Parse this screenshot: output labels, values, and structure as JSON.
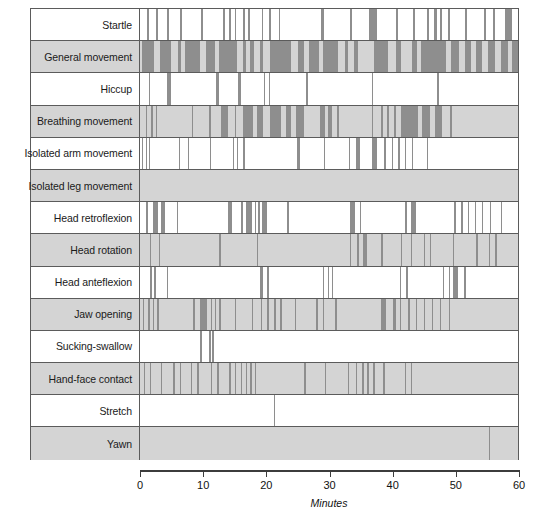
{
  "chart_data": {
    "type": "bar",
    "title": "",
    "subtitle": "",
    "xlabel": "Minutes",
    "ylabel": "",
    "xlim": [
      0,
      60
    ],
    "xticks": [
      0,
      10,
      20,
      30,
      40,
      50,
      60
    ],
    "xtick_labels": [
      "0",
      "10",
      "20",
      "30",
      "40",
      "50",
      "60"
    ],
    "grid": false,
    "legend": "none",
    "bar_color": "#8e8e8e",
    "shaded_row_color": "#d4d4d4",
    "plain_row_color": "#ffffff",
    "border_color": "#5b5b5b",
    "categories": [
      "Startle",
      "General movement",
      "Hiccup",
      "Breathing movement",
      "Isolated arm movement",
      "Isolated leg movement",
      "Head retroflexion",
      "Head rotation",
      "Head anteflexion",
      "Jaw opening",
      "Sucking-swallow",
      "Hand-face contact",
      "Stretch",
      "Yawn"
    ],
    "series": [
      {
        "name": "Startle",
        "shaded": false,
        "events": [
          [
            1.1,
            1.4
          ],
          [
            2.5,
            2.8
          ],
          [
            4.3,
            4.6
          ],
          [
            6.3,
            6.6
          ],
          [
            9.7,
            10.0
          ],
          [
            13.2,
            13.5
          ],
          [
            14.1,
            14.4
          ],
          [
            15.0,
            15.3
          ],
          [
            16.3,
            16.6
          ],
          [
            17.1,
            17.4
          ],
          [
            19.3,
            19.6
          ],
          [
            20.4,
            20.8
          ],
          [
            22.0,
            22.3
          ],
          [
            28.8,
            29.2
          ],
          [
            33.3,
            33.6
          ],
          [
            36.3,
            37.6
          ],
          [
            40.7,
            41.0
          ],
          [
            43.4,
            43.7
          ],
          [
            45.6,
            45.9
          ],
          [
            46.7,
            47.1
          ],
          [
            47.6,
            47.9
          ],
          [
            48.9,
            49.2
          ],
          [
            51.6,
            51.9
          ],
          [
            54.6,
            54.9
          ],
          [
            56.0,
            56.3
          ],
          [
            58.0,
            59.1
          ]
        ]
      },
      {
        "name": "General movement",
        "shaded": true,
        "events": [
          [
            0.3,
            2.3
          ],
          [
            3.2,
            5.0
          ],
          [
            6.0,
            6.5
          ],
          [
            7.1,
            9.6
          ],
          [
            10.4,
            11.9
          ],
          [
            12.6,
            15.4
          ],
          [
            16.3,
            16.8
          ],
          [
            17.5,
            18.1
          ],
          [
            19.0,
            19.6
          ],
          [
            20.6,
            24.0
          ],
          [
            25.0,
            26.0
          ],
          [
            26.8,
            28.4
          ],
          [
            29.1,
            31.4
          ],
          [
            32.6,
            33.0
          ],
          [
            34.0,
            34.6
          ],
          [
            37.1,
            39.3
          ],
          [
            40.6,
            41.4
          ],
          [
            43.2,
            44.0
          ],
          [
            44.6,
            48.6
          ],
          [
            49.4,
            50.7
          ],
          [
            51.6,
            52.6
          ],
          [
            53.3,
            54.3
          ],
          [
            55.2,
            56.3
          ],
          [
            57.3,
            58.4
          ],
          [
            59.0,
            60.0
          ]
        ]
      },
      {
        "name": "Hiccup",
        "shaded": false,
        "events": [
          [
            1.4,
            1.6
          ],
          [
            4.3,
            4.9
          ],
          [
            12.0,
            12.6
          ],
          [
            15.5,
            16.1
          ],
          [
            19.7,
            19.9
          ],
          [
            20.5,
            20.7
          ],
          [
            26.4,
            26.6
          ],
          [
            36.8,
            37.0
          ],
          [
            47.2,
            47.4
          ]
        ]
      },
      {
        "name": "Breathing movement",
        "shaded": true,
        "events": [
          [
            0.9,
            1.1
          ],
          [
            1.8,
            2.1
          ],
          [
            2.5,
            2.7
          ],
          [
            8.2,
            8.4
          ],
          [
            10.9,
            11.2
          ],
          [
            12.8,
            14.0
          ],
          [
            15.0,
            15.3
          ],
          [
            16.3,
            18.0
          ],
          [
            18.6,
            19.6
          ],
          [
            20.6,
            22.4
          ],
          [
            23.1,
            24.0
          ],
          [
            24.8,
            26.0
          ],
          [
            28.5,
            29.3
          ],
          [
            29.9,
            30.4
          ],
          [
            31.2,
            31.6
          ],
          [
            36.8,
            37.0
          ],
          [
            38.2,
            38.6
          ],
          [
            39.2,
            39.5
          ],
          [
            40.3,
            40.6
          ],
          [
            41.5,
            44.1
          ],
          [
            44.8,
            46.0
          ],
          [
            46.8,
            48.0
          ],
          [
            49.2,
            49.6
          ]
        ]
      },
      {
        "name": "Isolated arm movement",
        "shaded": false,
        "events": [
          [
            0.3,
            0.5
          ],
          [
            0.9,
            1.1
          ],
          [
            1.4,
            1.6
          ],
          [
            6.2,
            6.4
          ],
          [
            7.6,
            7.8
          ],
          [
            11.1,
            11.3
          ],
          [
            14.7,
            14.9
          ],
          [
            15.4,
            15.6
          ],
          [
            16.4,
            16.6
          ],
          [
            24.9,
            25.4
          ],
          [
            29.2,
            29.4
          ],
          [
            33.1,
            33.3
          ],
          [
            34.3,
            34.9
          ],
          [
            36.8,
            37.6
          ],
          [
            38.8,
            39.0
          ],
          [
            40.0,
            40.2
          ],
          [
            41.0,
            41.2
          ],
          [
            42.1,
            42.3
          ],
          [
            43.1,
            43.3
          ],
          [
            45.5,
            45.7
          ]
        ]
      },
      {
        "name": "Isolated leg movement",
        "shaded": true,
        "events": []
      },
      {
        "name": "Head retroflexion",
        "shaded": false,
        "events": [
          [
            1.0,
            1.2
          ],
          [
            2.1,
            2.9
          ],
          [
            3.3,
            3.9
          ],
          [
            5.8,
            6.0
          ],
          [
            14.0,
            14.6
          ],
          [
            16.1,
            16.4
          ],
          [
            16.9,
            17.8
          ],
          [
            18.2,
            18.4
          ],
          [
            18.8,
            19.0
          ],
          [
            19.4,
            20.2
          ],
          [
            23.4,
            23.6
          ],
          [
            33.4,
            34.1
          ],
          [
            34.9,
            35.1
          ],
          [
            42.0,
            42.4
          ],
          [
            43.0,
            43.8
          ],
          [
            49.9,
            50.1
          ],
          [
            51.0,
            51.2
          ],
          [
            52.1,
            52.3
          ],
          [
            53.2,
            53.4
          ],
          [
            54.3,
            54.5
          ],
          [
            55.5,
            55.7
          ],
          [
            57.3,
            57.5
          ]
        ]
      },
      {
        "name": "Head rotation",
        "shaded": true,
        "events": [
          [
            1.6,
            1.8
          ],
          [
            3.0,
            3.2
          ],
          [
            12.6,
            12.8
          ],
          [
            18.6,
            18.8
          ],
          [
            33.3,
            33.5
          ],
          [
            34.5,
            34.7
          ],
          [
            35.4,
            36.0
          ],
          [
            38.3,
            38.5
          ],
          [
            41.4,
            41.6
          ],
          [
            43.0,
            43.2
          ],
          [
            45.0,
            45.2
          ],
          [
            46.0,
            46.2
          ],
          [
            49.7,
            49.9
          ],
          [
            53.4,
            53.6
          ],
          [
            55.4,
            55.6
          ],
          [
            56.4,
            56.6
          ]
        ]
      },
      {
        "name": "Head anteflexion",
        "shaded": false,
        "events": [
          [
            1.6,
            1.9
          ],
          [
            2.2,
            2.5
          ],
          [
            4.3,
            4.5
          ],
          [
            19.0,
            19.6
          ],
          [
            20.2,
            20.4
          ],
          [
            29.0,
            29.2
          ],
          [
            29.8,
            30.0
          ],
          [
            30.5,
            30.7
          ],
          [
            41.3,
            41.5
          ],
          [
            42.3,
            42.5
          ],
          [
            48.1,
            48.3
          ],
          [
            49.0,
            49.2
          ],
          [
            49.7,
            50.5
          ],
          [
            51.5,
            51.7
          ]
        ]
      },
      {
        "name": "Jaw opening",
        "shaded": true,
        "events": [
          [
            0.5,
            0.7
          ],
          [
            1.3,
            1.6
          ],
          [
            2.0,
            2.3
          ],
          [
            2.7,
            3.0
          ],
          [
            8.4,
            8.7
          ],
          [
            9.6,
            10.6
          ],
          [
            11.2,
            11.4
          ],
          [
            11.9,
            12.1
          ],
          [
            12.6,
            12.8
          ],
          [
            15.1,
            15.3
          ],
          [
            17.8,
            18.0
          ],
          [
            19.2,
            19.4
          ],
          [
            20.2,
            20.5
          ],
          [
            21.3,
            21.6
          ],
          [
            22.3,
            22.5
          ],
          [
            24.6,
            24.8
          ],
          [
            28.0,
            28.2
          ],
          [
            29.0,
            29.2
          ],
          [
            31.0,
            31.2
          ],
          [
            38.3,
            39.1
          ],
          [
            40.2,
            40.6
          ],
          [
            41.3,
            41.5
          ],
          [
            42.6,
            42.8
          ],
          [
            43.8,
            44.0
          ],
          [
            45.0,
            45.2
          ],
          [
            46.3,
            46.5
          ],
          [
            47.6,
            47.8
          ],
          [
            49.0,
            49.2
          ]
        ]
      },
      {
        "name": "Sucking-swallow",
        "shaded": false,
        "events": [
          [
            9.6,
            9.8
          ],
          [
            11.0,
            11.2
          ],
          [
            11.5,
            11.7
          ]
        ]
      },
      {
        "name": "Hand-face contact",
        "shaded": true,
        "events": [
          [
            0.6,
            0.8
          ],
          [
            1.6,
            1.8
          ],
          [
            3.3,
            3.5
          ],
          [
            5.3,
            5.5
          ],
          [
            6.3,
            6.5
          ],
          [
            8.1,
            8.3
          ],
          [
            9.1,
            9.3
          ],
          [
            11.3,
            11.5
          ],
          [
            12.3,
            12.5
          ],
          [
            14.2,
            14.5
          ],
          [
            15.1,
            15.3
          ],
          [
            16.0,
            16.2
          ],
          [
            16.8,
            17.0
          ],
          [
            17.5,
            17.7
          ],
          [
            18.2,
            18.4
          ],
          [
            26.0,
            26.3
          ],
          [
            29.3,
            29.5
          ],
          [
            33.0,
            33.2
          ],
          [
            34.3,
            34.5
          ],
          [
            35.3,
            35.5
          ],
          [
            36.0,
            36.3
          ],
          [
            37.0,
            37.3
          ],
          [
            38.6,
            38.9
          ],
          [
            42.0,
            42.2
          ],
          [
            43.0,
            43.2
          ]
        ]
      },
      {
        "name": "Stretch",
        "shaded": false,
        "events": [
          [
            21.3,
            21.5
          ]
        ]
      },
      {
        "name": "Yawn",
        "shaded": true,
        "events": [
          [
            55.4,
            55.6
          ]
        ]
      }
    ]
  },
  "axis": {
    "title": "Minutes",
    "ticks": [
      "0",
      "10",
      "20",
      "30",
      "40",
      "50",
      "60"
    ]
  }
}
